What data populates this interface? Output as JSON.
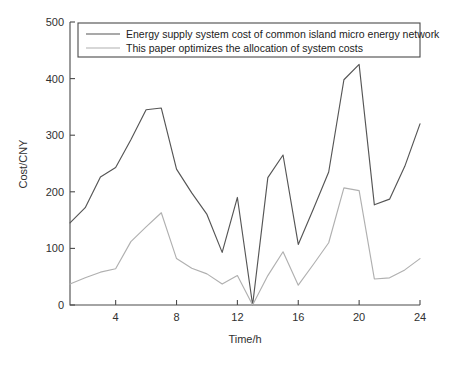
{
  "chart_data": {
    "type": "line",
    "title": "",
    "xlabel": "Time/h",
    "ylabel": "Cost/CNY",
    "xlim": [
      1,
      24
    ],
    "ylim": [
      0,
      500
    ],
    "grid": false,
    "legend_position": "top-inside",
    "x": [
      1,
      2,
      3,
      4,
      5,
      6,
      7,
      8,
      9,
      10,
      11,
      12,
      13,
      14,
      15,
      16,
      17,
      18,
      19,
      20,
      21,
      22,
      23,
      24
    ],
    "xticks": [
      "4",
      "8",
      "12",
      "16",
      "20",
      "24"
    ],
    "xtick_values": [
      4,
      8,
      12,
      16,
      20,
      24
    ],
    "yticks": [
      "0",
      "100",
      "200",
      "300",
      "400",
      "500"
    ],
    "ytick_values": [
      0,
      100,
      200,
      300,
      400,
      500
    ],
    "series": [
      {
        "name": "Energy supply system cost of common island micro energy network",
        "color": "#555555",
        "values": [
          145,
          172,
          226,
          243,
          292,
          345,
          348,
          240,
          198,
          160,
          93,
          190,
          0,
          225,
          265,
          107,
          170,
          235,
          398,
          425,
          177,
          187,
          245,
          320
        ]
      },
      {
        "name": "This paper optimizes the allocation of system costs",
        "color": "#b0b0b0",
        "values": [
          37,
          48,
          58,
          64,
          112,
          138,
          163,
          82,
          65,
          55,
          37,
          52,
          0,
          52,
          94,
          35,
          72,
          110,
          207,
          202,
          46,
          48,
          62,
          82
        ]
      }
    ]
  },
  "legend": {
    "entries": [
      {
        "label": "Energy supply system cost of common island micro energy network"
      },
      {
        "label": "This paper optimizes the allocation of system costs"
      }
    ]
  },
  "axes": {
    "x_label": "Time/h",
    "y_label": "Cost/CNY"
  }
}
